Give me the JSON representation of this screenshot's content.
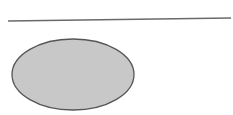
{
  "diagram": {
    "background": "#ffffff",
    "shapes": [
      {
        "type": "line",
        "name": "horizontal-line",
        "x1": 8,
        "y1": 21,
        "x2": 231,
        "y2": 18,
        "stroke": "#6a6a6a",
        "stroke_width": 1.3
      },
      {
        "type": "ellipse",
        "name": "gray-ellipse",
        "cx": 73,
        "cy": 74.5,
        "rx": 61,
        "ry": 35.5,
        "fill": "#c8c8c8",
        "stroke": "#555555",
        "stroke_width": 1.3
      }
    ]
  }
}
